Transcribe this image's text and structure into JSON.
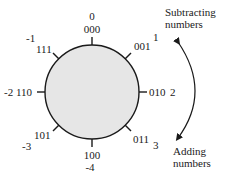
{
  "diagram": {
    "circle_fill": "#e6e6e6",
    "stroke_color": "#1a1a1a",
    "positions": [
      {
        "binary": "000",
        "decimal": "0"
      },
      {
        "binary": "001",
        "decimal": "1"
      },
      {
        "binary": "010",
        "decimal": "2"
      },
      {
        "binary": "011",
        "decimal": "3"
      },
      {
        "binary": "100",
        "decimal": "-4"
      },
      {
        "binary": "101",
        "decimal": "-3"
      },
      {
        "binary": "110",
        "decimal": "-2"
      },
      {
        "binary": "111",
        "decimal": "-1"
      }
    ],
    "arrow_top_label_line1": "Subtracting",
    "arrow_top_label_line2": "numbers",
    "arrow_bottom_label_line1": "Adding",
    "arrow_bottom_label_line2": "numbers"
  }
}
